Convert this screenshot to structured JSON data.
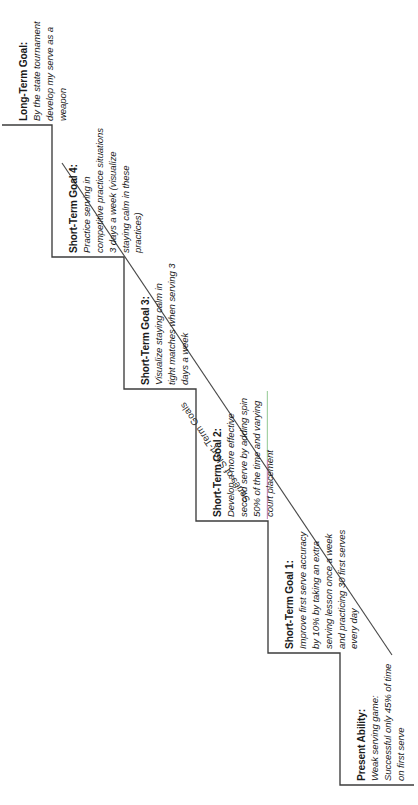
{
  "figure": {
    "type": "staircase-diagram",
    "orientation": "rotated-90-ccw",
    "background_color": "#ffffff",
    "line_color": "#3c3c3c",
    "accent_colors": {
      "magenta_edge": "#b36bb0",
      "green_edge": "#7fbf7f"
    },
    "diagonal_label": "Series of Short-Term Goals"
  },
  "steps": [
    {
      "id": "present-ability",
      "title": "Present Ability:",
      "body": "Weak serving game: Successful only 45% of time on first serve"
    },
    {
      "id": "short-term-goal-1",
      "title": "Short-Term Goal 1:",
      "body": "Improve first serve accuracy by 10% by taking an extra serving lesson once a week and practicing 30 first serves every day"
    },
    {
      "id": "short-term-goal-2",
      "title": "Short-Term Goal 2:",
      "body": "Develop a more effective second serve by adding spin 50% of the time and varying court placement"
    },
    {
      "id": "short-term-goal-3",
      "title": "Short-Term Goal 3:",
      "body": "Visualize staying calm in tight matches when serving 3 days a week"
    },
    {
      "id": "short-term-goal-4",
      "title": "Short-Term Goal 4:",
      "body": "Practice serving in competitive practice situations 3 days a week (visualize staying calm in these practices)"
    },
    {
      "id": "long-term-goal",
      "title": "Long-Term Goal:",
      "body": "By the state tournament develop my serve as a weapon"
    }
  ]
}
